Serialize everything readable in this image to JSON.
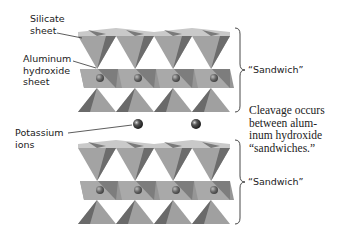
{
  "figure": {
    "labels": {
      "silicate_sheet": [
        "Silicate",
        "sheet"
      ],
      "aluminum_hydroxide_sheet": [
        "Aluminum",
        "hydroxide",
        "sheet"
      ],
      "potassium_ions": [
        "Potassium",
        "ions"
      ],
      "sandwich_top": "“Sandwich”",
      "sandwich_bottom": "“Sandwich”",
      "cleavage_note": [
        "Cleavage occurs",
        "between alum-",
        "inum hydroxide",
        "“sandwiches.”"
      ]
    },
    "colors": {
      "tetra_light": "#bdbdbd",
      "tetra_mid": "#9a9a9a",
      "tetra_dark": "#6f6f6f",
      "octa": "#8e8e8e",
      "ion": "#3a3a3a",
      "text": "#1a1a1a"
    },
    "structure": {
      "layers": [
        "silicate sheet",
        "aluminum hydroxide sheet",
        "silicate sheet"
      ],
      "sandwich_count": 2,
      "potassium_ion_count": 2
    }
  }
}
